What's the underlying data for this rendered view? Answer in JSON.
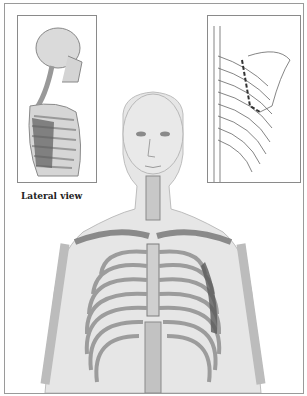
{
  "figure": {
    "insets": {
      "left": {
        "caption": "Lateral view"
      },
      "right": {
        "caption": ""
      }
    },
    "colors": {
      "skin": "#e4e4e4",
      "bone": "#c6c6c6",
      "bone_outline": "#7d7d7d",
      "highlight_muscle": "#5b5b5b",
      "frame": "#9a9a9a"
    }
  }
}
